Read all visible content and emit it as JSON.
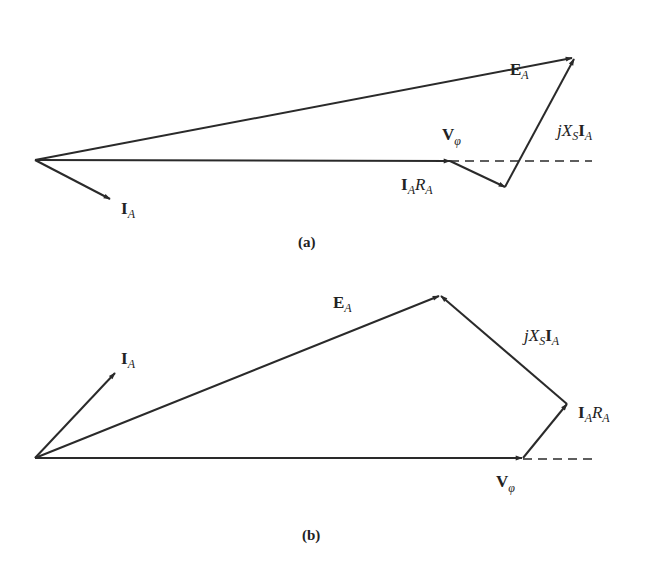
{
  "colors": {
    "stroke": "#2a2a2a",
    "text": "#222222",
    "background": "#ffffff"
  },
  "diagrams": [
    {
      "caption": "(a)",
      "phasors": [
        {
          "name": "V_phi",
          "from": [
            35,
            160
          ],
          "to": [
            450,
            161
          ]
        },
        {
          "name": "I_A",
          "from": [
            35,
            160
          ],
          "to": [
            110,
            199
          ]
        },
        {
          "name": "E_A",
          "from": [
            35,
            160
          ],
          "to": [
            573,
            58
          ]
        },
        {
          "name": "I_A R_A",
          "from": [
            450,
            161
          ],
          "to": [
            505,
            187
          ]
        },
        {
          "name": "jX_S I_A",
          "from": [
            505,
            187
          ],
          "to": [
            573,
            58
          ]
        }
      ],
      "dashed_reference": {
        "from": [
          450,
          161
        ],
        "to": [
          592,
          161
        ]
      },
      "labels": {
        "E_A": {
          "main": "E",
          "sub": "A"
        },
        "V_phi": {
          "main": "V",
          "sub": "φ"
        },
        "IARA": {
          "main1": "I",
          "sub1": "A",
          "main2": "R",
          "sub2": "A"
        },
        "jXSIA": {
          "j": "j",
          "X": "X",
          "subS": "S",
          "I": "I",
          "subA": "A"
        },
        "I_A": {
          "main": "I",
          "sub": "A"
        }
      }
    },
    {
      "caption": "(b)",
      "phasors": [
        {
          "name": "V_phi",
          "from": [
            35,
            458
          ],
          "to": [
            523,
            458
          ]
        },
        {
          "name": "I_A",
          "from": [
            35,
            458
          ],
          "to": [
            115,
            373
          ]
        },
        {
          "name": "E_A",
          "from": [
            35,
            458
          ],
          "to": [
            440,
            295
          ]
        },
        {
          "name": "I_A R_A",
          "from": [
            523,
            458
          ],
          "to": [
            567,
            404
          ]
        },
        {
          "name": "jX_S I_A",
          "from": [
            567,
            404
          ],
          "to": [
            440,
            295
          ]
        }
      ],
      "dashed_reference": {
        "from": [
          523,
          459
        ],
        "to": [
          598,
          459
        ]
      },
      "labels": {
        "E_A": {
          "main": "E",
          "sub": "A"
        },
        "V_phi": {
          "main": "V",
          "sub": "φ"
        },
        "IARA": {
          "main1": "I",
          "sub1": "A",
          "main2": "R",
          "sub2": "A"
        },
        "jXSIA": {
          "j": "j",
          "X": "X",
          "subS": "S",
          "I": "I",
          "subA": "A"
        },
        "I_A": {
          "main": "I",
          "sub": "A"
        }
      }
    }
  ]
}
